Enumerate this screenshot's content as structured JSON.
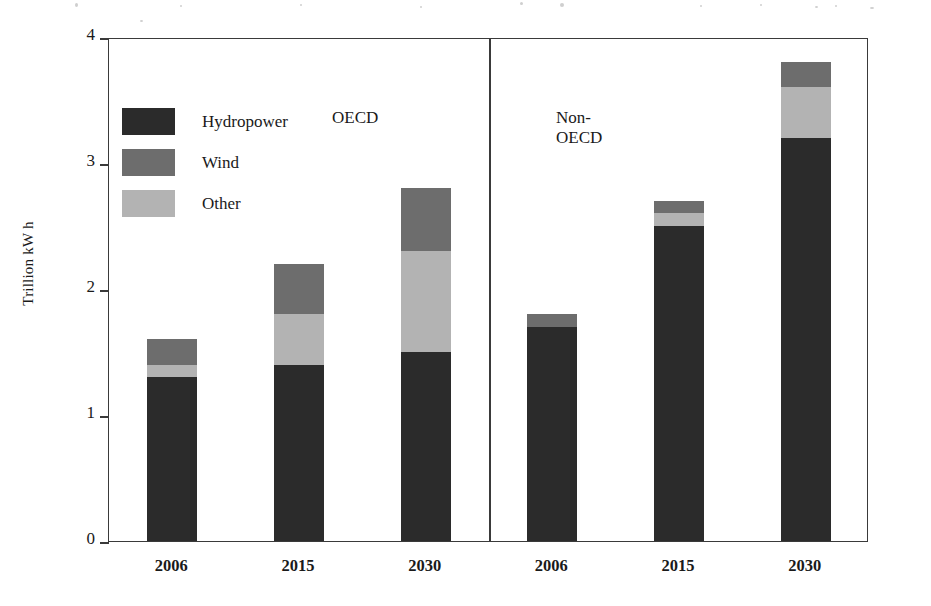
{
  "chart_data": {
    "type": "bar",
    "title": "",
    "subtitle": "",
    "xlabel": "",
    "ylabel": "Trillion kW h",
    "ylim": [
      0,
      4
    ],
    "yticks": [
      "0",
      "1",
      "2",
      "3",
      "4"
    ],
    "grid": false,
    "stacked": true,
    "legend_position": "inside-upper-left",
    "panels": [
      {
        "label": "OECD",
        "categories": [
          "2006",
          "2015",
          "2030"
        ],
        "series": [
          {
            "name": "Hydropower",
            "values": [
              1.3,
              1.4,
              1.5
            ]
          },
          {
            "name": "Other",
            "values": [
              0.1,
              0.4,
              0.8
            ]
          },
          {
            "name": "Wind",
            "values": [
              0.2,
              0.4,
              0.5
            ]
          }
        ],
        "totals": [
          1.6,
          2.2,
          2.8
        ]
      },
      {
        "label": "Non-\nOECD",
        "categories": [
          "2006",
          "2015",
          "2030"
        ],
        "series": [
          {
            "name": "Hydropower",
            "values": [
              1.7,
              2.5,
              3.2
            ]
          },
          {
            "name": "Other",
            "values": [
              0.0,
              0.1,
              0.4
            ]
          },
          {
            "name": "Wind",
            "values": [
              0.1,
              0.1,
              0.2
            ]
          }
        ],
        "totals": [
          1.8,
          2.7,
          3.8
        ]
      }
    ],
    "legend": [
      {
        "name": "Hydropower",
        "color": "#2b2b2b"
      },
      {
        "name": "Wind",
        "color": "#6d6d6d"
      },
      {
        "name": "Other",
        "color": "#b3b3b3"
      }
    ],
    "colors": {
      "hydropower": "#2b2b2b",
      "wind": "#6d6d6d",
      "other": "#b3b3b3",
      "axis": "#3a3a3a",
      "background": "#ffffff"
    }
  }
}
